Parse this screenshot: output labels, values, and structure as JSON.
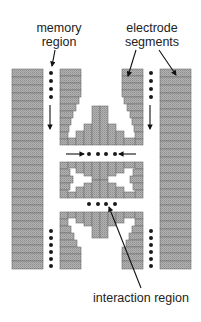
{
  "labels": {
    "memory_region": [
      "memory",
      "region"
    ],
    "electrode_segments": [
      "electrode",
      "segments"
    ],
    "interaction_region": "interaction region"
  },
  "colors": {
    "segment_fill": "#a9a9a9",
    "segment_stroke": "#6e6e6e",
    "ion": "#1a1a1a",
    "arrow": "#111111"
  },
  "ions": {
    "memory_left_top": 4,
    "memory_right_top": 4,
    "memory_left_bottom": 6,
    "memory_right_bottom": 6,
    "center_upper": 4,
    "center_lower": 4
  }
}
